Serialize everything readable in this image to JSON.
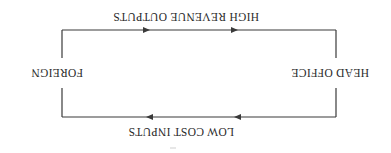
{
  "diagram": {
    "orientation": "rotated-180",
    "nodes": {
      "left": "HEAD OFFICE",
      "right": "FOREIGN"
    },
    "flows": {
      "top": {
        "label": "LOW COST INPUTS",
        "direction": "from HEAD OFFICE to FOREIGN"
      },
      "bottom": {
        "label": "HIGH REVENUE OUTPUTS",
        "direction": "from FOREIGN to HEAD OFFICE"
      }
    },
    "colors": {
      "line": "#3a3a3a",
      "text": "#2a2a2a",
      "background": "#ffffff"
    }
  }
}
